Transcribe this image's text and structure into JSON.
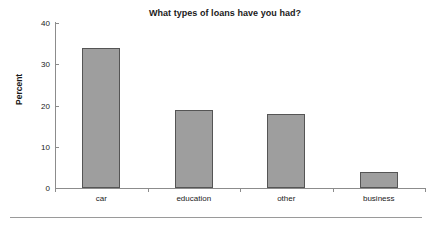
{
  "chart_data": {
    "type": "bar",
    "title": "What types of loans have you had?",
    "xlabel": "",
    "ylabel": "Percent",
    "categories": [
      "car",
      "education",
      "other",
      "business"
    ],
    "values": [
      34,
      19,
      18,
      4
    ],
    "ylim": [
      0,
      40
    ],
    "yticks": [
      0,
      10,
      20,
      30,
      40
    ],
    "ytick_labels": [
      "0",
      "10",
      "20",
      "30",
      "40"
    ],
    "grid": false,
    "legend": false,
    "series": [
      {
        "name": "Percent",
        "values": [
          34,
          19,
          18,
          4
        ]
      }
    ],
    "colors": {
      "bar_fill": "#9e9e9e",
      "bar_border": "#555555",
      "axis": "#8c8c8c",
      "text": "#1a1a1a",
      "background": "#ffffff",
      "rule": "#9a9a9a"
    }
  }
}
